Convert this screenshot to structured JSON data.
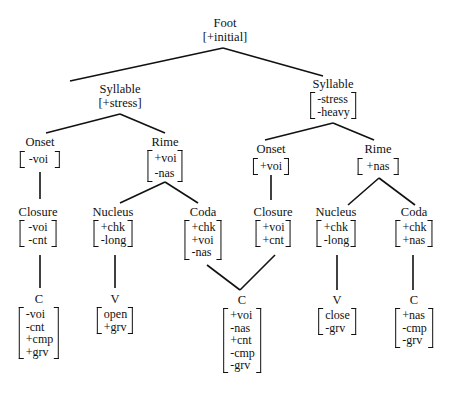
{
  "diagram": {
    "type": "feature-geometry tree",
    "nodes": {
      "foot": {
        "label": "Foot",
        "features_inline": "[+initial]"
      },
      "syl1": {
        "label": "Syllable",
        "features_inline": "[+stress]"
      },
      "syl2": {
        "label": "Syllable",
        "features": [
          "-stress",
          "-heavy"
        ]
      },
      "onset1": {
        "label": "Onset",
        "features": [
          "-voi"
        ]
      },
      "rime1": {
        "label": "Rime",
        "features": [
          "+voi",
          "-nas"
        ]
      },
      "onset2": {
        "label": "Onset",
        "features": [
          "+voi"
        ]
      },
      "rime2": {
        "label": "Rime",
        "features": [
          "+nas"
        ]
      },
      "closure1": {
        "label": "Closure",
        "features": [
          "-voi",
          "-cnt"
        ]
      },
      "nucleus1": {
        "label": "Nucleus",
        "features": [
          "+chk",
          "-long"
        ]
      },
      "coda1": {
        "label": "Coda",
        "features": [
          "+chk",
          "+voi",
          "-nas"
        ]
      },
      "closure2": {
        "label": "Closure",
        "features": [
          "+voi",
          "+cnt"
        ]
      },
      "nucleus2": {
        "label": "Nucleus",
        "features": [
          "+chk",
          "-long"
        ]
      },
      "coda2": {
        "label": "Coda",
        "features": [
          "+chk",
          "+nas"
        ]
      },
      "c1": {
        "label": "C",
        "features": [
          "-voi",
          "-cnt",
          "+cmp",
          "+grv"
        ]
      },
      "v1": {
        "label": "V",
        "features": [
          "open",
          "+grv"
        ]
      },
      "c2": {
        "label": "C",
        "features": [
          "+voi",
          "-nas",
          "+cnt",
          "-cmp",
          "-grv"
        ]
      },
      "v2": {
        "label": "V",
        "features": [
          "close",
          "-grv"
        ]
      },
      "c3": {
        "label": "C",
        "features": [
          "+nas",
          "-cmp",
          "-grv"
        ]
      }
    },
    "edges": [
      [
        "foot",
        "syl1"
      ],
      [
        "foot",
        "syl2"
      ],
      [
        "syl1",
        "onset1"
      ],
      [
        "syl1",
        "rime1"
      ],
      [
        "syl2",
        "onset2"
      ],
      [
        "syl2",
        "rime2"
      ],
      [
        "onset1",
        "closure1"
      ],
      [
        "rime1",
        "nucleus1"
      ],
      [
        "rime1",
        "coda1"
      ],
      [
        "onset2",
        "closure2"
      ],
      [
        "rime2",
        "nucleus2"
      ],
      [
        "rime2",
        "coda2"
      ],
      [
        "closure1",
        "c1"
      ],
      [
        "nucleus1",
        "v1"
      ],
      [
        "coda1",
        "c2"
      ],
      [
        "closure2",
        "c2"
      ],
      [
        "nucleus2",
        "v2"
      ],
      [
        "coda2",
        "c3"
      ]
    ]
  }
}
